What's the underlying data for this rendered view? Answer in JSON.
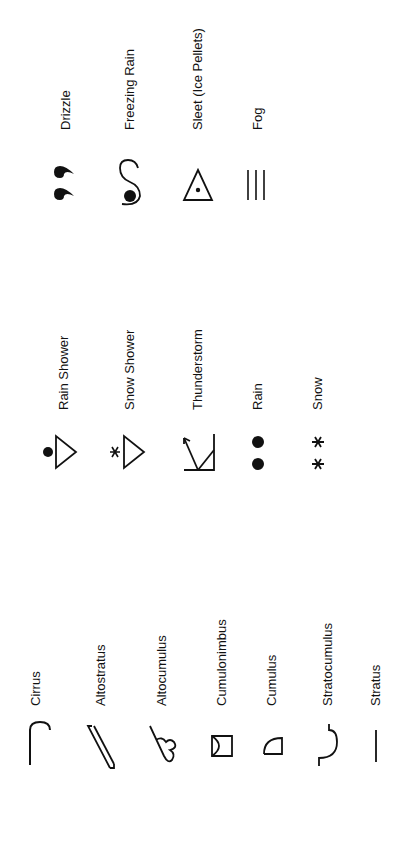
{
  "groups": {
    "clouds": {
      "items": [
        {
          "label": "Cirrus",
          "icon": "cirrus-icon"
        },
        {
          "label": "Altostratus",
          "icon": "altostratus-icon"
        },
        {
          "label": "Altocumulus",
          "icon": "altocumulus-icon"
        },
        {
          "label": "Cumulonimbus",
          "icon": "cumulonimbus-icon"
        },
        {
          "label": "Cumulus",
          "icon": "cumulus-icon"
        },
        {
          "label": "Stratocumulus",
          "icon": "stratocumulus-icon"
        },
        {
          "label": "Stratus",
          "icon": "stratus-icon"
        }
      ]
    },
    "precipitation": {
      "items": [
        {
          "label": "Rain Shower",
          "icon": "rain-shower-icon"
        },
        {
          "label": "Snow Shower",
          "icon": "snow-shower-icon"
        },
        {
          "label": "Thunderstorm",
          "icon": "thunderstorm-icon"
        },
        {
          "label": "Rain",
          "icon": "rain-icon"
        },
        {
          "label": "Snow",
          "icon": "snow-icon"
        }
      ]
    },
    "other": {
      "items": [
        {
          "label": "Drizzle",
          "icon": "drizzle-icon"
        },
        {
          "label": "Freezing Rain",
          "icon": "freezing-rain-icon"
        },
        {
          "label": "Sleet (Ice Pellets)",
          "icon": "sleet-icon"
        },
        {
          "label": "Fog",
          "icon": "fog-icon"
        }
      ]
    }
  },
  "colors": {
    "ink": "#111111",
    "background": "#ffffff"
  }
}
